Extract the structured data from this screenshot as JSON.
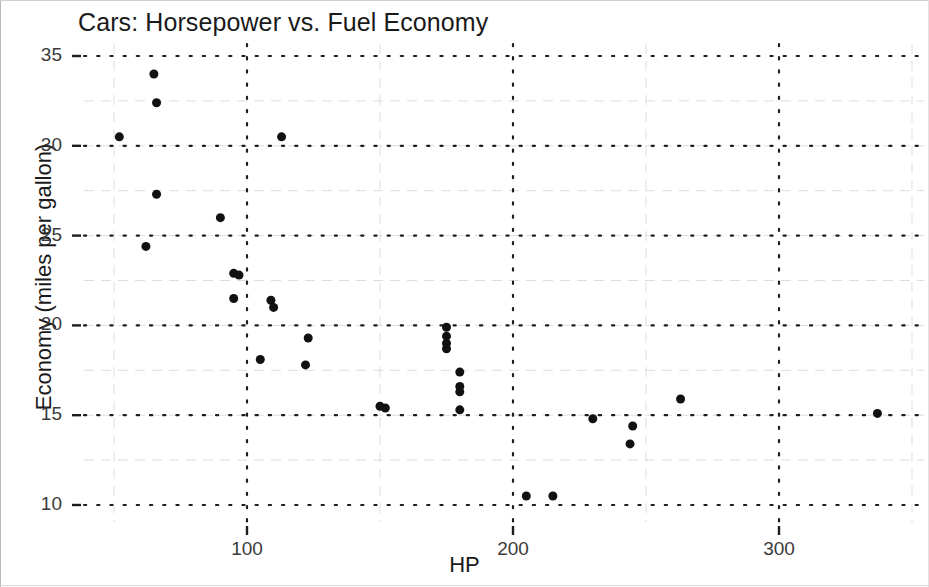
{
  "chart_data": {
    "type": "scatter",
    "title": "Cars: Horsepower vs. Fuel Economy",
    "xlabel": "HP",
    "ylabel": "Economy (miles per gallon)",
    "xlim": [
      40,
      350
    ],
    "ylim": [
      9,
      36
    ],
    "xticks": [
      100,
      200,
      300
    ],
    "yticks": [
      35,
      30,
      25,
      20,
      15,
      10
    ],
    "grid": true,
    "grid_style": "dotted",
    "legend": null,
    "marker": {
      "shape": "circle",
      "color": "#111111",
      "size": 9
    },
    "background": "#ffffff",
    "points": [
      {
        "x": 52,
        "y": 30.5
      },
      {
        "x": 65,
        "y": 34.0
      },
      {
        "x": 66,
        "y": 32.4
      },
      {
        "x": 66,
        "y": 27.3
      },
      {
        "x": 62,
        "y": 24.4
      },
      {
        "x": 90,
        "y": 26.0
      },
      {
        "x": 95,
        "y": 22.9
      },
      {
        "x": 97,
        "y": 22.8
      },
      {
        "x": 95,
        "y": 21.5
      },
      {
        "x": 109,
        "y": 21.4
      },
      {
        "x": 110,
        "y": 21.0
      },
      {
        "x": 113,
        "y": 30.5
      },
      {
        "x": 105,
        "y": 18.1
      },
      {
        "x": 123,
        "y": 19.3
      },
      {
        "x": 122,
        "y": 17.8
      },
      {
        "x": 150,
        "y": 15.5
      },
      {
        "x": 152,
        "y": 15.4
      },
      {
        "x": 175,
        "y": 19.9
      },
      {
        "x": 175,
        "y": 19.4
      },
      {
        "x": 175,
        "y": 19.0
      },
      {
        "x": 175,
        "y": 18.7
      },
      {
        "x": 180,
        "y": 17.4
      },
      {
        "x": 180,
        "y": 16.6
      },
      {
        "x": 180,
        "y": 16.3
      },
      {
        "x": 180,
        "y": 15.3
      },
      {
        "x": 205,
        "y": 10.5
      },
      {
        "x": 215,
        "y": 10.5
      },
      {
        "x": 230,
        "y": 14.8
      },
      {
        "x": 245,
        "y": 14.4
      },
      {
        "x": 244,
        "y": 13.4
      },
      {
        "x": 263,
        "y": 15.9
      },
      {
        "x": 337,
        "y": 15.1
      }
    ]
  }
}
